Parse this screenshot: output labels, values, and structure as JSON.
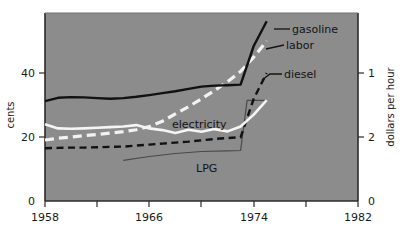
{
  "chart_data": {
    "type": "line",
    "title": "",
    "xlabel": "",
    "ylabel": "cents",
    "y2label": "dollars per hour",
    "xlim": [
      1958,
      1982
    ],
    "ylim": [
      0,
      57
    ],
    "y2lim_note": "right axis descending: 0 at bottom, 2 mid, 1 upper",
    "grid": false,
    "legend": "inline-annotations",
    "xticks": [
      1958,
      1962,
      1966,
      1970,
      1974,
      1978,
      1982
    ],
    "xticklabels": [
      "1958",
      "",
      "1966",
      "",
      "1974",
      "",
      "1982"
    ],
    "yticks": [
      0,
      20,
      40
    ],
    "yticklabels": [
      "0",
      "20",
      "40"
    ],
    "y2ticks": [
      0,
      2,
      1
    ],
    "y2ticklabels": [
      "0",
      "2",
      "1"
    ],
    "series": [
      {
        "name": "gasoline",
        "style": "solid",
        "color": "#111111",
        "axis": "left",
        "unit": "cents",
        "x": [
          1958,
          1959,
          1960,
          1961,
          1962,
          1963,
          1964,
          1965,
          1966,
          1967,
          1968,
          1969,
          1970,
          1971,
          1972,
          1973,
          1974,
          1975
        ],
        "values": [
          30.3,
          31.3,
          31.5,
          31.4,
          31.2,
          31.0,
          31.2,
          31.6,
          32.1,
          32.7,
          33.3,
          34.0,
          34.7,
          35.0,
          35.1,
          35.3,
          47.0,
          54.5
        ]
      },
      {
        "name": "labor",
        "style": "dashed",
        "color": "#f2f2f2",
        "axis": "right",
        "unit": "dollars per hour",
        "x": [
          1958,
          1959,
          1960,
          1961,
          1962,
          1963,
          1964,
          1965,
          1966,
          1967,
          1968,
          1969,
          1970,
          1971,
          1972,
          1973,
          1974,
          1975
        ],
        "values_in_cents_scale": [
          18.5,
          19.0,
          19.4,
          19.8,
          20.2,
          20.6,
          21.0,
          21.6,
          22.6,
          24.2,
          26.4,
          28.6,
          31.0,
          33.5,
          36.2,
          39.3,
          43.6,
          48.5
        ]
      },
      {
        "name": "diesel",
        "style": "dashed",
        "color": "#111111",
        "axis": "left",
        "unit": "cents",
        "x": [
          1958,
          1959,
          1960,
          1961,
          1962,
          1963,
          1964,
          1965,
          1966,
          1967,
          1968,
          1969,
          1970,
          1971,
          1972,
          1973,
          1974,
          1975
        ],
        "values": [
          16.0,
          16.1,
          16.2,
          16.2,
          16.3,
          16.4,
          16.5,
          16.8,
          17.1,
          17.4,
          17.7,
          18.0,
          18.4,
          18.8,
          19.1,
          19.3,
          31.0,
          38.8
        ]
      },
      {
        "name": "electricity",
        "style": "solid",
        "color": "#f5f5f5",
        "axis": "left",
        "unit": "cents",
        "x": [
          1958,
          1959,
          1960,
          1961,
          1962,
          1963,
          1964,
          1965,
          1966,
          1967,
          1968,
          1969,
          1970,
          1971,
          1972,
          1973,
          1974,
          1975
        ],
        "values": [
          23.3,
          22.0,
          21.9,
          22.0,
          22.2,
          22.4,
          22.6,
          23.0,
          22.0,
          21.5,
          20.6,
          21.6,
          21.0,
          21.8,
          21.1,
          22.6,
          26.2,
          30.6
        ]
      },
      {
        "name": "LPG",
        "style": "solid-thin",
        "color": "#4a4a4a",
        "axis": "left",
        "unit": "cents",
        "x": [
          1964,
          1966,
          1968,
          1970,
          1972,
          1973,
          1973.5,
          1975
        ],
        "values": [
          12.3,
          13.5,
          14.4,
          15.0,
          15.2,
          15.3,
          30.5,
          30.5
        ]
      }
    ],
    "annotations": [
      {
        "text": "gasoline",
        "series": "gasoline"
      },
      {
        "text": "labor",
        "series": "labor"
      },
      {
        "text": "diesel",
        "series": "diesel"
      },
      {
        "text": "electricity",
        "series": "electricity"
      },
      {
        "text": "LPG",
        "series": "LPG"
      }
    ],
    "colors": {
      "plot_background": "#8c8c8c",
      "page_background": "#ffffff",
      "axis": "#2b2b2b",
      "text": "#1a1a1a"
    }
  },
  "axes": {
    "left_title": "cents",
    "right_title": "dollars per hour",
    "x_tick_1958": "1958",
    "x_tick_1966": "1966",
    "x_tick_1974": "1974",
    "x_tick_1982": "1982",
    "y_tick_0": "0",
    "y_tick_20": "20",
    "y_tick_40": "40",
    "y2_tick_0": "0",
    "y2_tick_1": "1",
    "y2_tick_2": "2"
  },
  "labels": {
    "gasoline": "gasoline",
    "labor": "labor",
    "diesel": "diesel",
    "electricity": "electricity",
    "lpg": "LPG"
  }
}
